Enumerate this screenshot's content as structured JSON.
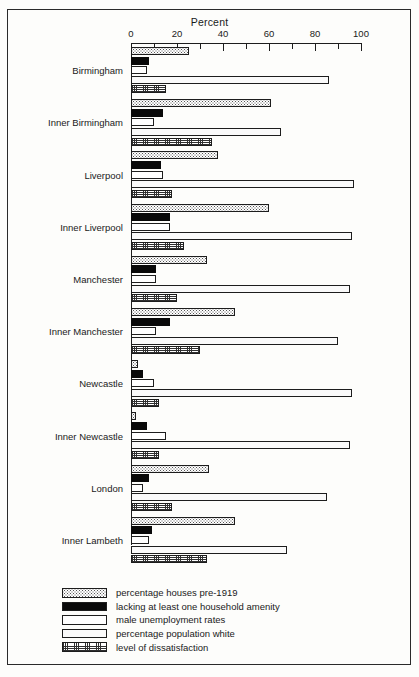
{
  "chart_data": {
    "type": "bar",
    "orientation": "horizontal",
    "title": "Percent",
    "xlabel": "Percent",
    "ylabel": "",
    "xlim": [
      0,
      100
    ],
    "xticks": [
      0,
      10,
      20,
      30,
      40,
      50,
      60,
      70,
      80,
      90,
      100
    ],
    "xticklabels_major": [
      "0",
      "20",
      "40",
      "60",
      "80",
      "100"
    ],
    "grid": false,
    "legend_position": "bottom-left",
    "categories": [
      "Birmingham",
      "Inner Birmingham",
      "Liverpool",
      "Inner Liverpool",
      "Manchester",
      "Inner Manchester",
      "Newcastle",
      "Inner Newcastle",
      "London",
      "Inner Lambeth"
    ],
    "series": [
      {
        "name": "percentage houses pre-1919",
        "pattern": "dots-sparse",
        "values": [
          25,
          61,
          38,
          60,
          33,
          45,
          3,
          2,
          34,
          45
        ]
      },
      {
        "name": "lacking at least one household amenity",
        "pattern": "black",
        "values": [
          8,
          14,
          13,
          17,
          11,
          17,
          5,
          7,
          8,
          9
        ]
      },
      {
        "name": "male unemployment rates",
        "pattern": "white",
        "values": [
          7,
          10,
          14,
          17,
          11,
          11,
          10,
          15,
          5,
          8
        ]
      },
      {
        "name": "percentage population white",
        "pattern": "dots-dense",
        "values": [
          86,
          65,
          97,
          96,
          95,
          90,
          96,
          95,
          85,
          68
        ]
      },
      {
        "name": "level of dissatisfaction",
        "pattern": "grid",
        "values": [
          15,
          35,
          18,
          23,
          20,
          30,
          12,
          12,
          18,
          33
        ]
      }
    ]
  },
  "legend": {
    "items": [
      {
        "label": "percentage houses pre-1919",
        "pattern": "dots-sparse"
      },
      {
        "label": "lacking at least one household amenity",
        "pattern": "black"
      },
      {
        "label": "male unemployment rates",
        "pattern": "white"
      },
      {
        "label": "percentage population white",
        "pattern": "dots-dense"
      },
      {
        "label": "level of dissatisfaction",
        "pattern": "grid"
      }
    ]
  }
}
